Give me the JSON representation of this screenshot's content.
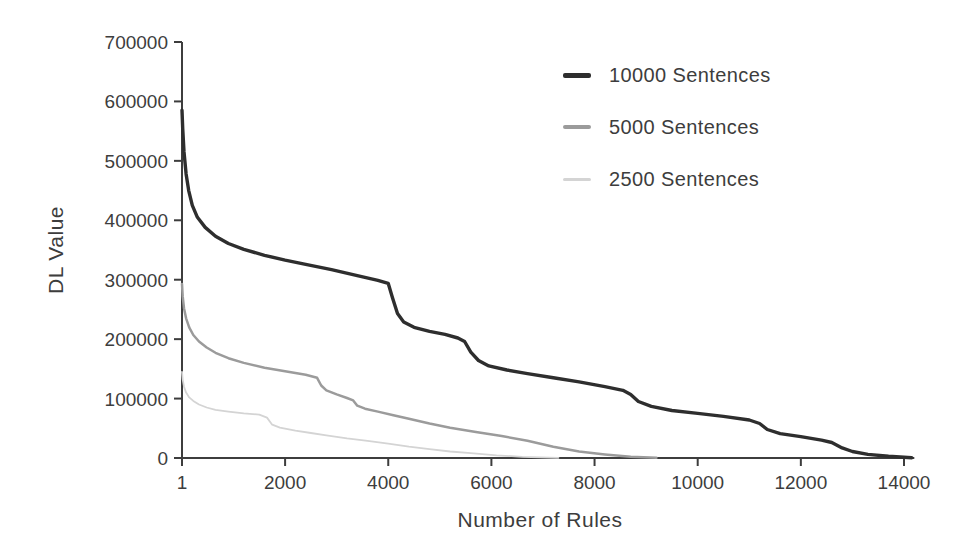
{
  "figure": {
    "background": "#ffffff",
    "text_color": "#3d3d3d",
    "axis_color": "#3d3d3d"
  },
  "chart_data": {
    "type": "line",
    "title": "",
    "xlabel": "Number of Rules",
    "ylabel": "DL Value",
    "xlim": [
      1,
      14200
    ],
    "ylim": [
      0,
      700000
    ],
    "x_ticks": [
      1,
      2000,
      4000,
      6000,
      8000,
      10000,
      12000,
      14000
    ],
    "y_ticks": [
      0,
      100000,
      200000,
      300000,
      400000,
      500000,
      600000,
      700000
    ],
    "grid": false,
    "legend_position": "upper right",
    "series": [
      {
        "name": "10000 Sentences",
        "color": "#2e2e2e",
        "width": 3.4,
        "swatch_height": 5,
        "points": [
          [
            1,
            585000
          ],
          [
            15,
            555000
          ],
          [
            40,
            515000
          ],
          [
            80,
            478000
          ],
          [
            130,
            450000
          ],
          [
            200,
            425000
          ],
          [
            300,
            405000
          ],
          [
            450,
            388000
          ],
          [
            650,
            373000
          ],
          [
            900,
            361000
          ],
          [
            1200,
            351000
          ],
          [
            1600,
            341000
          ],
          [
            2000,
            333000
          ],
          [
            2400,
            326000
          ],
          [
            2900,
            317000
          ],
          [
            3400,
            307000
          ],
          [
            3800,
            299000
          ],
          [
            4000,
            294000
          ],
          [
            4080,
            270000
          ],
          [
            4180,
            243000
          ],
          [
            4300,
            229000
          ],
          [
            4500,
            220000
          ],
          [
            4800,
            213000
          ],
          [
            5100,
            208000
          ],
          [
            5350,
            202000
          ],
          [
            5480,
            196000
          ],
          [
            5600,
            178000
          ],
          [
            5750,
            164000
          ],
          [
            5950,
            155000
          ],
          [
            6300,
            148000
          ],
          [
            6700,
            142000
          ],
          [
            7200,
            135000
          ],
          [
            7700,
            128000
          ],
          [
            8200,
            120000
          ],
          [
            8550,
            114000
          ],
          [
            8700,
            107000
          ],
          [
            8850,
            95000
          ],
          [
            9100,
            87000
          ],
          [
            9500,
            80000
          ],
          [
            10000,
            75000
          ],
          [
            10500,
            70000
          ],
          [
            11000,
            64000
          ],
          [
            11200,
            58000
          ],
          [
            11350,
            48000
          ],
          [
            11600,
            41000
          ],
          [
            12000,
            36000
          ],
          [
            12400,
            30000
          ],
          [
            12600,
            26000
          ],
          [
            12800,
            17000
          ],
          [
            13000,
            11000
          ],
          [
            13300,
            6000
          ],
          [
            13700,
            3000
          ],
          [
            14150,
            500
          ]
        ]
      },
      {
        "name": "5000 Sentences",
        "color": "#9b9b9b",
        "width": 2.5,
        "swatch_height": 4,
        "points": [
          [
            1,
            293000
          ],
          [
            15,
            272000
          ],
          [
            40,
            252000
          ],
          [
            80,
            235000
          ],
          [
            140,
            220000
          ],
          [
            220,
            207000
          ],
          [
            330,
            196000
          ],
          [
            480,
            186000
          ],
          [
            650,
            177000
          ],
          [
            900,
            168000
          ],
          [
            1200,
            160000
          ],
          [
            1600,
            152000
          ],
          [
            2000,
            146000
          ],
          [
            2400,
            140000
          ],
          [
            2620,
            135000
          ],
          [
            2700,
            122000
          ],
          [
            2800,
            114000
          ],
          [
            3000,
            107000
          ],
          [
            3200,
            101000
          ],
          [
            3320,
            97000
          ],
          [
            3400,
            88000
          ],
          [
            3550,
            83000
          ],
          [
            3800,
            78000
          ],
          [
            4100,
            72000
          ],
          [
            4400,
            66000
          ],
          [
            4800,
            58000
          ],
          [
            5200,
            51000
          ],
          [
            5700,
            44000
          ],
          [
            6200,
            37000
          ],
          [
            6700,
            29000
          ],
          [
            7200,
            19000
          ],
          [
            7700,
            11000
          ],
          [
            8200,
            6000
          ],
          [
            8700,
            2000
          ],
          [
            9200,
            300
          ]
        ]
      },
      {
        "name": "2500 Sentences",
        "color": "#d4d4d4",
        "width": 1.8,
        "swatch_height": 3,
        "points": [
          [
            1,
            145000
          ],
          [
            15,
            132000
          ],
          [
            40,
            120000
          ],
          [
            80,
            110000
          ],
          [
            140,
            102000
          ],
          [
            220,
            96000
          ],
          [
            330,
            90000
          ],
          [
            480,
            85000
          ],
          [
            650,
            81000
          ],
          [
            900,
            78000
          ],
          [
            1200,
            75000
          ],
          [
            1500,
            73000
          ],
          [
            1650,
            68000
          ],
          [
            1750,
            56000
          ],
          [
            1900,
            51000
          ],
          [
            2200,
            46000
          ],
          [
            2500,
            42000
          ],
          [
            2800,
            38000
          ],
          [
            3200,
            33000
          ],
          [
            3600,
            29000
          ],
          [
            4000,
            24000
          ],
          [
            4400,
            19000
          ],
          [
            4800,
            15000
          ],
          [
            5200,
            11000
          ],
          [
            5600,
            8000
          ],
          [
            6100,
            4500
          ],
          [
            6600,
            2000
          ],
          [
            7300,
            300
          ]
        ]
      }
    ]
  }
}
